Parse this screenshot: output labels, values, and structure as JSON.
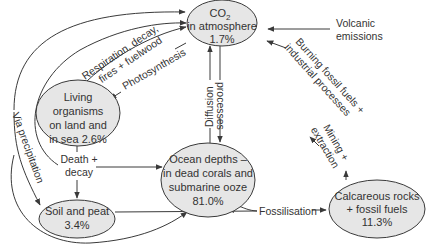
{
  "diagram": {
    "colors": {
      "node_fill": "#e6e6e6",
      "stroke": "#3a3a3a",
      "text": "#333333"
    },
    "nodes": {
      "co2": {
        "line1": "CO",
        "sub": "2",
        "line2": "in atmosphere",
        "line3": "1.7%"
      },
      "living": {
        "line1": "Living",
        "line2": "organisms",
        "line3": "on land and",
        "line4": "in sea 2.6%"
      },
      "ocean": {
        "line1": "Ocean depths –",
        "line2": "in dead corals and",
        "line3": "submarine ooze",
        "line4": "81.0%"
      },
      "soil": {
        "line1": "Soil and peat",
        "line2": "3.4%"
      },
      "calcareous": {
        "line1": "Calcareous rocks",
        "line2": "+ fossil fuels",
        "line3": "11.3%"
      }
    },
    "edges": {
      "respiration": {
        "line1": "Respiration, decay,",
        "line2": "fires + fuelwood"
      },
      "photosynthesis": "Photosynthesis",
      "volcanic": {
        "line1": "Volcanic",
        "line2": "emissions"
      },
      "burning": {
        "line1": "Burning fossil fuels +",
        "line2": "industrial processes"
      },
      "mining": {
        "line1": "Mining +",
        "line2": "extraction"
      },
      "diffusion": "Diffusion",
      "processes": "processes",
      "death": {
        "line1": "Death +",
        "line2": "decay"
      },
      "fossilisation": "Fossilisation",
      "precipitation": "Via precipitation"
    }
  }
}
